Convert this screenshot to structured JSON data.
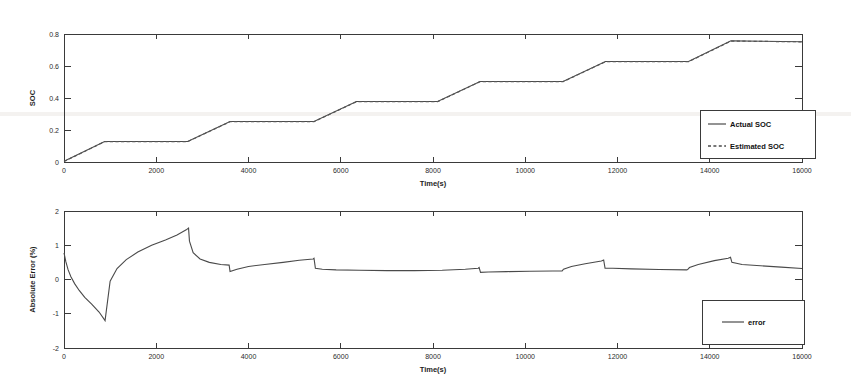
{
  "figure": {
    "background_color": "#ffffff",
    "line_color": "#4a4a4a",
    "axis_color": "#3a3a3a"
  },
  "chart_data": [
    {
      "id": "soc-chart",
      "type": "line",
      "title": "",
      "xlabel": "Time(s)",
      "ylabel": "SOC",
      "xlim": [
        0,
        16000
      ],
      "ylim": [
        0,
        0.8
      ],
      "xticks": [
        0,
        2000,
        4000,
        6000,
        8000,
        10000,
        12000,
        14000,
        16000
      ],
      "xtick_labels": [
        "0",
        "2000",
        "4000",
        "6000",
        "8000",
        "10000",
        "12000",
        "14000",
        "16000"
      ],
      "yticks": [
        0,
        0.2,
        0.4,
        0.6,
        0.8
      ],
      "ytick_labels": [
        "0",
        "0.2",
        "0.4",
        "0.6",
        "0.8"
      ],
      "grid": false,
      "legend_position": "lower-right",
      "legend_entries": [
        {
          "label": "Actual SOC",
          "style": "solid"
        },
        {
          "label": "Estimated SOC",
          "style": "dashed"
        }
      ],
      "series": [
        {
          "name": "Actual SOC",
          "style": "solid",
          "x": [
            0,
            880,
            2680,
            3600,
            5420,
            6340,
            8100,
            9020,
            10820,
            11740,
            13540,
            14460,
            16000
          ],
          "values": [
            0.005,
            0.128,
            0.128,
            0.253,
            0.253,
            0.378,
            0.378,
            0.503,
            0.503,
            0.628,
            0.628,
            0.757,
            0.752
          ]
        },
        {
          "name": "Estimated SOC",
          "style": "dashed",
          "x": [
            0,
            880,
            2680,
            3600,
            5420,
            6340,
            8100,
            9020,
            10820,
            11740,
            13540,
            14460,
            16000
          ],
          "values": [
            0.003,
            0.127,
            0.127,
            0.252,
            0.252,
            0.377,
            0.377,
            0.502,
            0.502,
            0.627,
            0.627,
            0.756,
            0.751
          ]
        }
      ]
    },
    {
      "id": "error-chart",
      "type": "line",
      "title": "",
      "xlabel": "Time(s)",
      "ylabel": "Absolute Error (%)",
      "xlim": [
        0,
        16000
      ],
      "ylim": [
        -2,
        2
      ],
      "xticks": [
        0,
        2000,
        4000,
        6000,
        8000,
        10000,
        12000,
        14000,
        16000
      ],
      "xtick_labels": [
        "0",
        "2000",
        "4000",
        "6000",
        "8000",
        "10000",
        "12000",
        "14000",
        "16000"
      ],
      "yticks": [
        -2,
        -1,
        0,
        1,
        2
      ],
      "ytick_labels": [
        "-2",
        "-1",
        "0",
        "1",
        "2"
      ],
      "grid": false,
      "legend_position": "lower-right",
      "legend_entries": [
        {
          "label": "error",
          "style": "solid"
        }
      ],
      "series": [
        {
          "name": "error",
          "style": "solid",
          "x": [
            0,
            40,
            90,
            150,
            230,
            330,
            450,
            600,
            760,
            880,
            890,
            1000,
            1150,
            1350,
            1600,
            1900,
            2200,
            2450,
            2650,
            2700,
            2720,
            2800,
            2950,
            3150,
            3400,
            3580,
            3600,
            3750,
            4000,
            4350,
            4750,
            5100,
            5400,
            5420,
            5450,
            5600,
            5900,
            6400,
            7000,
            7600,
            8200,
            8700,
            8980,
            9000,
            9030,
            9200,
            9600,
            10100,
            10600,
            10800,
            10830,
            11000,
            11300,
            11650,
            11700,
            11730,
            11900,
            12300,
            12900,
            13500,
            13520,
            13560,
            13750,
            14100,
            14400,
            14450,
            14480,
            14700,
            15100,
            15550,
            16000
          ],
          "values": [
            0.78,
            0.52,
            0.28,
            0.08,
            -0.12,
            -0.32,
            -0.52,
            -0.72,
            -0.95,
            -1.18,
            -1.2,
            -0.05,
            0.32,
            0.58,
            0.8,
            1.0,
            1.15,
            1.3,
            1.45,
            1.5,
            1.12,
            0.78,
            0.6,
            0.5,
            0.44,
            0.42,
            0.23,
            0.3,
            0.38,
            0.44,
            0.5,
            0.56,
            0.6,
            0.62,
            0.33,
            0.3,
            0.28,
            0.27,
            0.26,
            0.26,
            0.27,
            0.3,
            0.33,
            0.35,
            0.21,
            0.22,
            0.23,
            0.24,
            0.25,
            0.25,
            0.3,
            0.38,
            0.46,
            0.54,
            0.57,
            0.33,
            0.33,
            0.31,
            0.29,
            0.28,
            0.29,
            0.35,
            0.44,
            0.55,
            0.62,
            0.65,
            0.5,
            0.44,
            0.4,
            0.36,
            0.32
          ]
        }
      ]
    }
  ]
}
